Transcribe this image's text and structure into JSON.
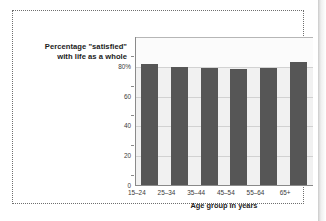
{
  "figure": {
    "title_lines": [
      "Percentage \"satisfied\"",
      "with life as a whole"
    ],
    "frame_style": "dotted",
    "bar_color": "#565656",
    "plot_background": "#f1f1f1",
    "gridline_color": "#d2d2d2"
  },
  "chart_data": {
    "type": "bar",
    "categories": [
      "15–24",
      "25–34",
      "35–44",
      "45–54",
      "55–64",
      "65+"
    ],
    "values": [
      81,
      79,
      78.5,
      78,
      78.5,
      82.5
    ],
    "xlabel": "Age group in years",
    "ylabel": "",
    "ylim": [
      0,
      100
    ],
    "yticks": [
      0,
      20,
      40,
      60,
      80
    ],
    "ytick_labels": [
      "0",
      "20",
      "40",
      "60",
      "80%"
    ],
    "grid": true,
    "legend": "none",
    "series": [
      {
        "name": "Percentage \"satisfied\" with life as a whole",
        "values": [
          81,
          79,
          78.5,
          78,
          78.5,
          82.5
        ]
      }
    ]
  }
}
